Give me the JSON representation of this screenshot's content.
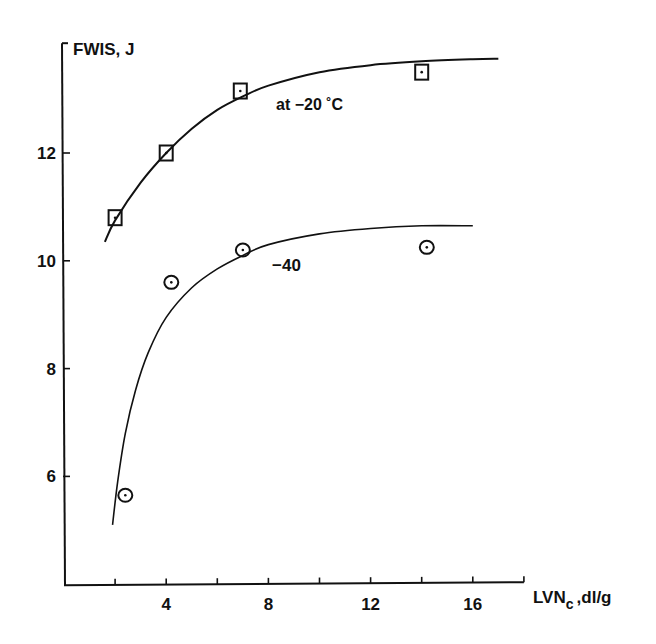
{
  "chart_data": {
    "type": "scatter",
    "title": "",
    "xlabel": "LVNc, dl/g",
    "xlabel_main": "LVN",
    "xlabel_sub": "c",
    "xlabel_unit": ",dl/g",
    "ylabel": "FWIS, J",
    "xlim": [
      0,
      18
    ],
    "ylim": [
      4,
      14
    ],
    "grid": false,
    "x_ticks": [
      2,
      4,
      6,
      8,
      10,
      12,
      14,
      16,
      18
    ],
    "x_tick_labels": [
      "4",
      "8",
      "12",
      "16"
    ],
    "x_tick_label_values": [
      4,
      8,
      12,
      16
    ],
    "y_ticks": [
      6,
      8,
      10,
      12
    ],
    "y_tick_labels": [
      "6",
      "8",
      "10",
      "12"
    ],
    "series": [
      {
        "name": "at -20 °C",
        "label": "at  −20 ˚C",
        "marker": "square",
        "x": [
          2.0,
          4.0,
          6.9,
          14.0
        ],
        "y": [
          10.8,
          12.0,
          13.15,
          13.5
        ],
        "fit_curve": {
          "x": [
            1.6,
            2.0,
            3.0,
            4.0,
            5.0,
            6.0,
            7.0,
            8.0,
            10.0,
            12.0,
            14.0,
            16.0,
            17.0
          ],
          "y": [
            10.35,
            10.75,
            11.45,
            12.0,
            12.45,
            12.8,
            13.05,
            13.25,
            13.5,
            13.63,
            13.7,
            13.74,
            13.75
          ]
        }
      },
      {
        "name": "at -40 °C",
        "label": "−40",
        "marker": "circle",
        "x": [
          2.4,
          4.2,
          7.0,
          14.2
        ],
        "y": [
          5.65,
          9.6,
          10.2,
          10.25
        ],
        "fit_curve": {
          "x": [
            1.9,
            2.1,
            2.4,
            2.8,
            3.3,
            4.0,
            5.0,
            6.0,
            7.0,
            8.0,
            10.0,
            12.0,
            14.0,
            16.0
          ],
          "y": [
            5.1,
            5.9,
            6.8,
            7.6,
            8.3,
            8.95,
            9.5,
            9.85,
            10.1,
            10.3,
            10.5,
            10.6,
            10.65,
            10.65
          ]
        }
      }
    ],
    "annotations": [
      {
        "text": "at  −20 ˚C",
        "x": 8.5,
        "y": 12.85
      },
      {
        "text": "−40",
        "x": 8.2,
        "y": 9.95
      }
    ]
  }
}
